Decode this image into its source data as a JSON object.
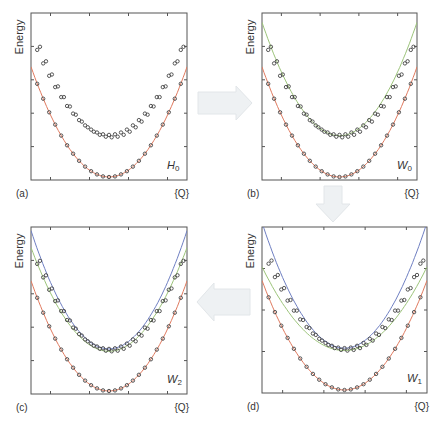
{
  "figure": {
    "arrows": [
      {
        "from": "a",
        "to": "b",
        "direction": "right"
      },
      {
        "from": "b",
        "to": "d",
        "direction": "down"
      },
      {
        "from": "d",
        "to": "c",
        "direction": "left"
      }
    ]
  },
  "colors": {
    "fit_lower": "#e07a5f",
    "fit_green": "#9cc47a",
    "fit_blue": "#6f7fc2",
    "markers": "#444444"
  },
  "chart_data": [
    {
      "id": "a",
      "type": "scatter",
      "panel_label": "(a)",
      "operator_label": "H",
      "operator_sub": "0",
      "ylabel": "Energy",
      "xlabel": "{Q}",
      "xlim": [
        -1,
        1
      ],
      "ylim": [
        0,
        1
      ],
      "grid": false,
      "x_ticks": [
        -0.75,
        -0.25,
        0.25,
        0.75
      ],
      "y_ticks": [
        0.2,
        0.4,
        0.6,
        0.8
      ],
      "points": {
        "lower": {
          "curvature": 0.68,
          "offset": 0.0
        },
        "upper1": {
          "curvature": 0.62,
          "offset": 0.26
        },
        "upper2": {
          "curvature": 0.66,
          "offset": 0.245
        }
      },
      "curves": [
        {
          "name": "lower-fit",
          "color_key": "fit_lower",
          "curvature": 0.68,
          "offset": 0.0
        }
      ]
    },
    {
      "id": "b",
      "type": "scatter",
      "panel_label": "(b)",
      "operator_label": "W",
      "operator_sub": "0",
      "ylabel": "Energy",
      "xlabel": "{Q}",
      "xlim": [
        -1,
        1
      ],
      "ylim": [
        0,
        1
      ],
      "grid": false,
      "x_ticks": [
        -0.75,
        -0.25,
        0.25,
        0.75
      ],
      "y_ticks": [
        0.2,
        0.4,
        0.6,
        0.8
      ],
      "points": {
        "lower": {
          "curvature": 0.68,
          "offset": 0.0
        },
        "upper1": {
          "curvature": 0.62,
          "offset": 0.26
        },
        "upper2": {
          "curvature": 0.66,
          "offset": 0.245
        }
      },
      "curves": [
        {
          "name": "lower-fit",
          "color_key": "fit_lower",
          "curvature": 0.68,
          "offset": 0.0
        },
        {
          "name": "upper-fit-green",
          "color_key": "fit_green",
          "curvature": 0.7,
          "offset": 0.255
        }
      ]
    },
    {
      "id": "c",
      "type": "scatter",
      "panel_label": "(c)",
      "operator_label": "W",
      "operator_sub": "2",
      "ylabel": "Energy",
      "xlabel": "{Q}",
      "xlim": [
        -1,
        1
      ],
      "ylim": [
        0,
        1
      ],
      "grid": false,
      "x_ticks": [
        -0.75,
        -0.25,
        0.25,
        0.75
      ],
      "y_ticks": [
        0.2,
        0.4,
        0.6,
        0.8
      ],
      "points": {
        "lower": {
          "curvature": 0.68,
          "offset": 0.0
        },
        "upper1": {
          "curvature": 0.62,
          "offset": 0.26
        },
        "upper2": {
          "curvature": 0.66,
          "offset": 0.245
        }
      },
      "curves": [
        {
          "name": "lower-fit",
          "color_key": "fit_lower",
          "curvature": 0.68,
          "offset": 0.0
        },
        {
          "name": "upper-fit-green",
          "color_key": "fit_green",
          "curvature": 0.64,
          "offset": 0.245
        },
        {
          "name": "upper-fit-blue",
          "color_key": "fit_blue",
          "curvature": 0.73,
          "offset": 0.26
        }
      ]
    },
    {
      "id": "d",
      "type": "scatter",
      "panel_label": "(d)",
      "operator_label": "W",
      "operator_sub": "1",
      "ylabel": "Energy",
      "xlabel": "{Q}",
      "xlim": [
        -1,
        1
      ],
      "ylim": [
        0,
        1
      ],
      "grid": false,
      "x_ticks": [
        -0.75,
        -0.25,
        0.25,
        0.75
      ],
      "y_ticks": [
        0.25,
        0.5,
        0.75
      ],
      "points": {
        "lower": {
          "curvature": 0.68,
          "offset": 0.0
        },
        "upper1": {
          "curvature": 0.62,
          "offset": 0.26
        },
        "upper2": {
          "curvature": 0.66,
          "offset": 0.245
        }
      },
      "curves": [
        {
          "name": "lower-fit",
          "color_key": "fit_lower",
          "curvature": 0.68,
          "offset": 0.0
        },
        {
          "name": "upper-fit-green",
          "color_key": "fit_green",
          "curvature": 0.52,
          "offset": 0.245
        },
        {
          "name": "upper-fit-blue",
          "color_key": "fit_blue",
          "curvature": 0.78,
          "offset": 0.26
        }
      ]
    }
  ]
}
